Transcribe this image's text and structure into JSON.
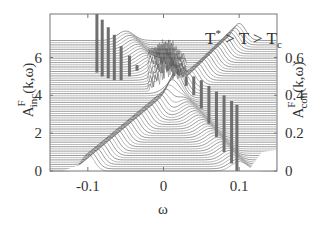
{
  "chart_data": {
    "type": "line",
    "subtype": "waterfall",
    "title": "",
    "annotation": {
      "text_parts": [
        "T",
        "*",
        " > T > T",
        "c"
      ],
      "full": "T* > T > Tc"
    },
    "xlabel": "ω",
    "ylabel_left": {
      "main": "A",
      "sup": "F",
      "sub": "inc",
      "args": "(k,ω)"
    },
    "ylabel_right": {
      "main": "A",
      "sup": "F",
      "sub": "coh",
      "args": "(k,ω)"
    },
    "xlim": [
      -0.15,
      0.15
    ],
    "ylim_left": [
      0,
      8.3
    ],
    "ylim_right": [
      0,
      0.83
    ],
    "x_ticks": [
      {
        "value": -0.1,
        "label": "-0.1"
      },
      {
        "value": 0,
        "label": "0"
      },
      {
        "value": 0.1,
        "label": "0.1"
      }
    ],
    "y_ticks_left": [
      {
        "value": 0,
        "label": "0"
      },
      {
        "value": 2,
        "label": "2"
      },
      {
        "value": 4,
        "label": "4"
      },
      {
        "value": 6,
        "label": "6"
      }
    ],
    "y_ticks_right": [
      {
        "value": 0,
        "label": "0"
      },
      {
        "value": 0.2,
        "label": "0.2"
      },
      {
        "value": 0.4,
        "label": "0.4"
      },
      {
        "value": 0.6,
        "label": "0.6"
      }
    ],
    "grid": false,
    "legend": null,
    "series": [
      {
        "name": "incoherent spectral function curves (stacked waterfall)",
        "axis": "left",
        "num_curves": 60,
        "dispersion_peak_positions": {
          "omega": [
            -0.1,
            -0.08,
            -0.06,
            -0.04,
            -0.02,
            0.0,
            0.02,
            0.04,
            0.05,
            0.06,
            0.08,
            0.1
          ],
          "offset": [
            0.0,
            1.5,
            3.0,
            4.5,
            5.7,
            6.4,
            7.0,
            7.6,
            7.9,
            6.0,
            3.0,
            0.0
          ]
        }
      },
      {
        "name": "coherent quasiparticle peaks (vertical bars)",
        "axis": "right",
        "bars": [
          {
            "omega": -0.088,
            "base": 0.52,
            "top": 0.83
          },
          {
            "omega": -0.081,
            "base": 0.5,
            "top": 0.8
          },
          {
            "omega": -0.073,
            "base": 0.49,
            "top": 0.76
          },
          {
            "omega": -0.065,
            "base": 0.48,
            "top": 0.72
          },
          {
            "omega": -0.056,
            "base": 0.48,
            "top": 0.66
          },
          {
            "omega": -0.045,
            "base": 0.5,
            "top": 0.61
          },
          {
            "omega": -0.035,
            "base": 0.53,
            "top": 0.56
          },
          {
            "omega": 0.02,
            "base": 0.55,
            "top": 0.56
          },
          {
            "omega": 0.03,
            "base": 0.45,
            "top": 0.5
          },
          {
            "omega": 0.04,
            "base": 0.4,
            "top": 0.5
          },
          {
            "omega": 0.05,
            "base": 0.33,
            "top": 0.48
          },
          {
            "omega": 0.06,
            "base": 0.25,
            "top": 0.45
          },
          {
            "omega": 0.07,
            "base": 0.18,
            "top": 0.42
          },
          {
            "omega": 0.08,
            "base": 0.1,
            "top": 0.4
          },
          {
            "omega": 0.09,
            "base": 0.04,
            "top": 0.37
          },
          {
            "omega": 0.097,
            "base": 0.0,
            "top": 0.35
          }
        ]
      }
    ]
  }
}
